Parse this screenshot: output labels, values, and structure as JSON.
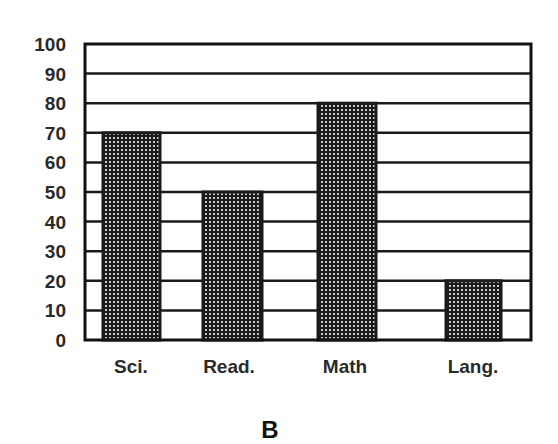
{
  "chart_data": {
    "type": "bar",
    "title": "",
    "caption": "B",
    "xlabel": "",
    "ylabel": "",
    "categories": [
      "Sci.",
      "Read.",
      "Math",
      "Lang."
    ],
    "values": [
      70,
      50,
      80,
      20
    ],
    "ylim": [
      0,
      100
    ],
    "yticks": [
      0,
      10,
      20,
      30,
      40,
      50,
      60,
      70,
      80,
      90,
      100
    ],
    "grid": "horizontal",
    "legend": null,
    "bar_fill": "dotted-dark",
    "colors": {
      "bar": "#1a1a1a",
      "dots": "#c8c8c8",
      "grid": "#1a1a1a",
      "frame": "#111111"
    }
  }
}
